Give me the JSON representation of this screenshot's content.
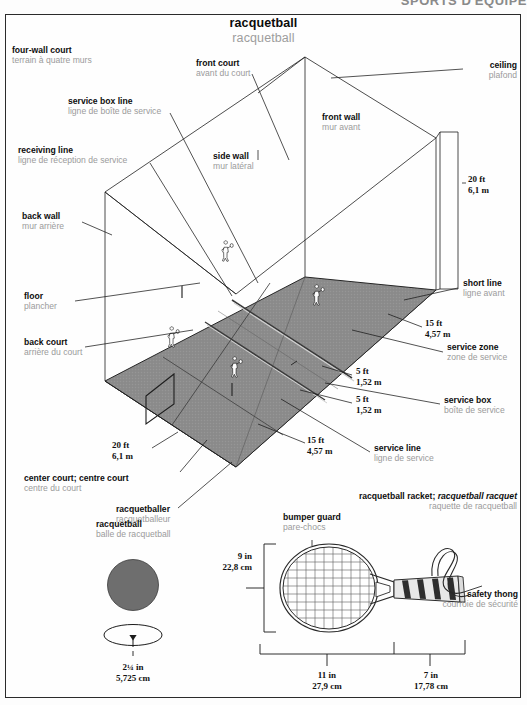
{
  "header": {
    "running_head": "SPORTS D'ÉQUIPE"
  },
  "title": {
    "en": "racquetball",
    "fr": "racquetball"
  },
  "court": {
    "four_wall_court": {
      "en": "four-wall court",
      "fr": "terrain à quatre murs"
    },
    "front_court": {
      "en": "front court",
      "fr": "avant du court"
    },
    "ceiling": {
      "en": "ceiling",
      "fr": "plafond"
    },
    "service_box_line": {
      "en": "service box line",
      "fr": "ligne de boîte de service"
    },
    "front_wall": {
      "en": "front wall",
      "fr": "mur avant"
    },
    "receiving_line": {
      "en": "receiving line",
      "fr": "ligne de réception de service"
    },
    "side_wall": {
      "en": "side wall",
      "fr": "mur latéral"
    },
    "back_wall": {
      "en": "back wall",
      "fr": "mur arrière"
    },
    "floor": {
      "en": "floor",
      "fr": "plancher"
    },
    "back_court": {
      "en": "back court",
      "fr": "arrière du court"
    },
    "short_line": {
      "en": "short line",
      "fr": "ligne avant"
    },
    "service_zone": {
      "en": "service zone",
      "fr": "zone de service"
    },
    "service_box": {
      "en": "service box",
      "fr": "boîte de service"
    },
    "service_line": {
      "en": "service line",
      "fr": "ligne de service"
    },
    "center_court": {
      "en": "center court; centre court",
      "fr": "centre du court"
    },
    "racquetballer": {
      "en": "racquetballer",
      "fr": "racquetballeur"
    }
  },
  "court_dimensions": {
    "wall_height": {
      "imperial": "20 ft",
      "metric": "6,1 m"
    },
    "court_width": {
      "imperial": "20 ft",
      "metric": "6,1 m"
    },
    "short_to_back": {
      "imperial": "15 ft",
      "metric": "4,57 m"
    },
    "service_zone": {
      "imperial": "5 ft",
      "metric": "1,52 m"
    },
    "service_box": {
      "imperial": "5 ft",
      "metric": "1,52 m"
    },
    "front_length": {
      "imperial": "15 ft",
      "metric": "4,57 m"
    }
  },
  "ball": {
    "label": {
      "en": "racquetball",
      "fr": "balle de racquetball"
    },
    "diameter": {
      "imperial": "2¼ in",
      "metric": "5,725 cm"
    }
  },
  "racket": {
    "label": {
      "en": "racquetball racket;",
      "en_italic": "racquetball racquet",
      "fr": "raquette de racquetball"
    },
    "bumper_guard": {
      "en": "bumper guard",
      "fr": "pare-chocs"
    },
    "safety_thong": {
      "en": "safety thong",
      "fr": "courroie de sécurité"
    },
    "head_width": {
      "imperial": "9 in",
      "metric": "22,8 cm"
    },
    "head_length": {
      "imperial": "11 in",
      "metric": "27,9 cm"
    },
    "handle_length": {
      "imperial": "7 in",
      "metric": "17,78 cm"
    }
  },
  "colors": {
    "floor_gray": "#8c8c8c",
    "ball_gray": "#6e6e6e",
    "label_fr": "#9b9b9b",
    "label_en": "#0d0d0d",
    "line": "#1a1a1a"
  }
}
